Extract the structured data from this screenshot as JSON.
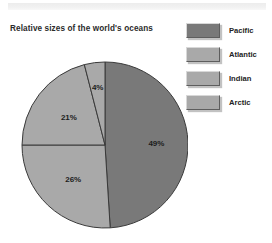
{
  "chart_data": {
    "type": "pie",
    "title": "Relative sizes of the world's oceans",
    "categories": [
      "Pacific",
      "Atlantic",
      "Indian",
      "Arctic"
    ],
    "values": [
      49,
      26,
      21,
      4
    ],
    "labels": [
      "49%",
      "26%",
      "21%",
      "4%"
    ],
    "unit": "%",
    "start_angle_deg": 0,
    "direction": "clockwise",
    "legend_position": "right",
    "grid": false,
    "colors": [
      "#797979",
      "#a9a9a9",
      "#a9a9a9",
      "#a9a9a9"
    ],
    "slice_border_color": "#3a3a3a",
    "label_color": "#1c1c1c",
    "background": "#ffffff"
  },
  "legend": {
    "items": [
      {
        "label": "Pacific",
        "color": "#797979"
      },
      {
        "label": "Atlantic",
        "color": "#a9a9a9"
      },
      {
        "label": "Indian",
        "color": "#a9a9a9"
      },
      {
        "label": "Arctic",
        "color": "#a9a9a9"
      }
    ]
  }
}
